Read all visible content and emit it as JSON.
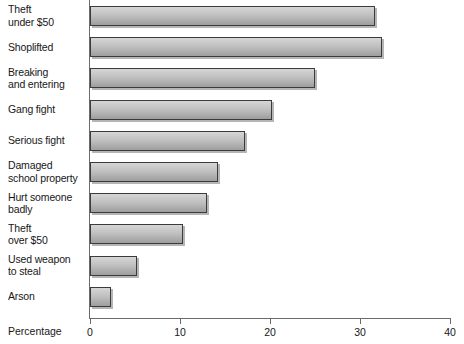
{
  "chart_data": {
    "type": "bar",
    "orientation": "horizontal",
    "title": "",
    "xlabel": "Percentage",
    "ylabel": "",
    "xlim": [
      0,
      40
    ],
    "xticks": [
      0,
      10,
      20,
      30,
      40
    ],
    "grid": false,
    "legend": null,
    "categories": [
      "Theft\nunder $50",
      "Shoplifted",
      "Breaking\nand entering",
      "Gang fight",
      "Serious fight",
      "Damaged\nschool property",
      "Hurt someone\nbadly",
      "Theft\nover $50",
      "Used weapon\nto steal",
      "Arson"
    ],
    "values": [
      31.7,
      32.4,
      25.0,
      20.2,
      17.2,
      14.2,
      13.0,
      10.3,
      5.2,
      2.3
    ]
  },
  "axis": {
    "x_label": "Percentage",
    "tick_labels": [
      "0",
      "10",
      "20",
      "30",
      "40"
    ]
  },
  "colors": {
    "bar_fill_top": "#d6d6d6",
    "bar_fill_bottom": "#9e9e9e",
    "bar_border": "#3b3b3b",
    "axis": "#6b6b6b",
    "text": "#171717",
    "background": "#ffffff"
  }
}
